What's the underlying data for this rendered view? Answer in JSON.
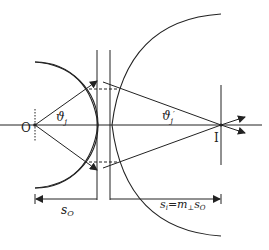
{
  "diagram": {
    "type": "optics-ray-diagram",
    "labels": {
      "object_point": "O",
      "image_point": "I",
      "angle_left": "ϑ",
      "angle_left_sub": "j",
      "angle_right": "ϑ",
      "angle_right_sub": "j",
      "angle_right_prime": "′",
      "object_distance_s": "s",
      "object_distance_sub": "O",
      "image_distance_s": "s",
      "image_distance_sub": "i",
      "image_distance_eq": "=m",
      "image_distance_m_sub": "⊥",
      "image_distance_s2": "s",
      "image_distance_s2_sub": "O"
    },
    "colors": {
      "line": "#222222",
      "background": "#ffffff"
    }
  }
}
